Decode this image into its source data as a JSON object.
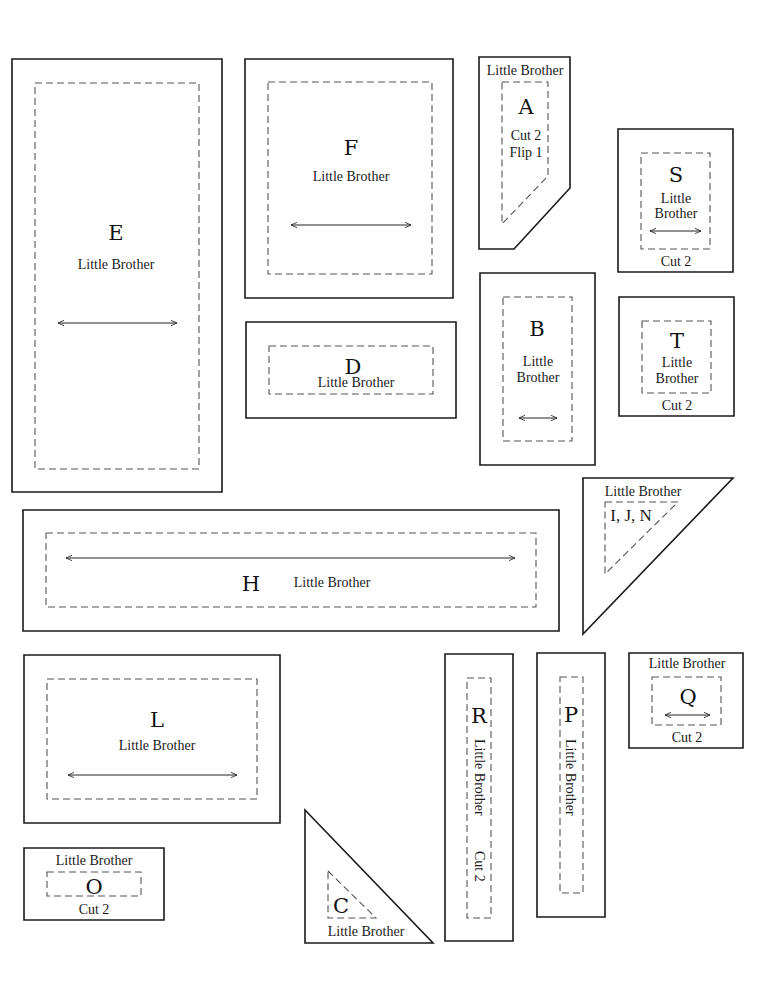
{
  "sheet": {
    "width": 782,
    "height": 986,
    "colors": {
      "background": "#ffffff",
      "cut_line": "#1a1a1a",
      "seam_line": "#555555",
      "text": "#1a1a1a"
    }
  },
  "pieces": [
    {
      "id": "E",
      "outline": [
        [
          12,
          59
        ],
        [
          222,
          59
        ],
        [
          222,
          492
        ],
        [
          12,
          492
        ]
      ],
      "seam": [
        [
          35,
          83
        ],
        [
          199,
          83
        ],
        [
          199,
          469
        ],
        [
          35,
          469
        ]
      ],
      "texts": [
        {
          "text": "E",
          "x": 116,
          "y": 240,
          "kind": "letter"
        },
        {
          "text": "Little Brother",
          "x": 116,
          "y": 269,
          "kind": "label"
        }
      ],
      "grainline": [
        58,
        323,
        177,
        323
      ]
    },
    {
      "id": "F",
      "outline": [
        [
          245,
          59
        ],
        [
          453,
          59
        ],
        [
          453,
          298
        ],
        [
          245,
          298
        ]
      ],
      "seam": [
        [
          268,
          82
        ],
        [
          432,
          82
        ],
        [
          432,
          274
        ],
        [
          268,
          274
        ]
      ],
      "texts": [
        {
          "text": "F",
          "x": 351,
          "y": 155,
          "kind": "letter"
        },
        {
          "text": "Little Brother",
          "x": 351,
          "y": 181,
          "kind": "label"
        }
      ],
      "grainline": [
        291,
        225,
        411,
        225
      ]
    },
    {
      "id": "A",
      "outline": [
        [
          479,
          57
        ],
        [
          570,
          57
        ],
        [
          570,
          188
        ],
        [
          514,
          249
        ],
        [
          479,
          249
        ]
      ],
      "seam": [
        [
          502,
          82
        ],
        [
          548,
          82
        ],
        [
          548,
          176
        ],
        [
          502,
          224
        ]
      ],
      "seam_open": false,
      "texts": [
        {
          "text": "Little Brother",
          "x": 525,
          "y": 75,
          "kind": "label"
        },
        {
          "text": "A",
          "x": 526,
          "y": 114,
          "kind": "letter"
        },
        {
          "text": "Cut 2",
          "x": 526,
          "y": 140,
          "kind": "label"
        },
        {
          "text": "Flip 1",
          "x": 526,
          "y": 157,
          "kind": "label"
        }
      ]
    },
    {
      "id": "S",
      "outline": [
        [
          618,
          129
        ],
        [
          733,
          129
        ],
        [
          733,
          272
        ],
        [
          618,
          272
        ]
      ],
      "seam": [
        [
          641,
          153
        ],
        [
          710,
          153
        ],
        [
          710,
          249
        ],
        [
          641,
          249
        ]
      ],
      "texts": [
        {
          "text": "S",
          "x": 676,
          "y": 182,
          "kind": "letter"
        },
        {
          "text": "Little",
          "x": 676,
          "y": 203,
          "kind": "label"
        },
        {
          "text": "Brother",
          "x": 676,
          "y": 218,
          "kind": "label"
        }
      ],
      "grainline": [
        650,
        231,
        701,
        231
      ],
      "caption": {
        "text": "Cut 2",
        "x": 676,
        "y": 266
      }
    },
    {
      "id": "D",
      "outline": [
        [
          246,
          322
        ],
        [
          456,
          322
        ],
        [
          456,
          418
        ],
        [
          246,
          418
        ]
      ],
      "seam": [
        [
          269,
          346
        ],
        [
          433,
          346
        ],
        [
          433,
          394
        ],
        [
          269,
          394
        ]
      ],
      "texts": [
        {
          "text": "D",
          "x": 353,
          "y": 374,
          "kind": "letter"
        },
        {
          "text": "Little Brother",
          "x": 356,
          "y": 387,
          "kind": "label"
        }
      ]
    },
    {
      "id": "B",
      "outline": [
        [
          480,
          273
        ],
        [
          595,
          273
        ],
        [
          595,
          465
        ],
        [
          480,
          465
        ]
      ],
      "seam": [
        [
          503,
          297
        ],
        [
          572,
          297
        ],
        [
          572,
          441
        ],
        [
          503,
          441
        ]
      ],
      "texts": [
        {
          "text": "B",
          "x": 537,
          "y": 336,
          "kind": "letter"
        },
        {
          "text": "Little",
          "x": 538,
          "y": 366,
          "kind": "label"
        },
        {
          "text": "Brother",
          "x": 538,
          "y": 382,
          "kind": "label"
        }
      ],
      "grainline": [
        519,
        418,
        557,
        418
      ]
    },
    {
      "id": "T",
      "outline": [
        [
          619,
          297
        ],
        [
          734,
          297
        ],
        [
          734,
          416
        ],
        [
          619,
          416
        ]
      ],
      "seam": [
        [
          642,
          321
        ],
        [
          711,
          321
        ],
        [
          711,
          393
        ],
        [
          642,
          393
        ]
      ],
      "texts": [
        {
          "text": "T",
          "x": 677,
          "y": 348,
          "kind": "letter"
        },
        {
          "text": "Little",
          "x": 677,
          "y": 367,
          "kind": "label"
        },
        {
          "text": "Brother",
          "x": 677,
          "y": 383,
          "kind": "label"
        }
      ],
      "caption": {
        "text": "Cut 2",
        "x": 677,
        "y": 410
      }
    },
    {
      "id": "H",
      "outline": [
        [
          23,
          510
        ],
        [
          559,
          510
        ],
        [
          559,
          631
        ],
        [
          23,
          631
        ]
      ],
      "seam": [
        [
          46,
          533
        ],
        [
          536,
          533
        ],
        [
          536,
          607
        ],
        [
          46,
          607
        ]
      ],
      "texts": [
        {
          "text": "H",
          "x": 251,
          "y": 591,
          "kind": "letter"
        },
        {
          "text": "Little Brother",
          "x": 332,
          "y": 587,
          "kind": "label"
        }
      ],
      "grainline": [
        66,
        558,
        515,
        558
      ]
    },
    {
      "id": "IJN",
      "outline": [
        [
          583,
          478
        ],
        [
          733,
          478
        ],
        [
          583,
          634
        ]
      ],
      "seam": [
        [
          605,
          502
        ],
        [
          678,
          502
        ],
        [
          605,
          574
        ]
      ],
      "texts": [
        {
          "text": "Little Brother",
          "x": 643,
          "y": 496,
          "kind": "label"
        },
        {
          "text": "I, J, N",
          "x": 631,
          "y": 521,
          "kind": "label-large"
        }
      ]
    },
    {
      "id": "L",
      "outline": [
        [
          24,
          655
        ],
        [
          280,
          655
        ],
        [
          280,
          823
        ],
        [
          24,
          823
        ]
      ],
      "seam": [
        [
          47,
          679
        ],
        [
          257,
          679
        ],
        [
          257,
          799
        ],
        [
          47,
          799
        ]
      ],
      "texts": [
        {
          "text": "L",
          "x": 157,
          "y": 727,
          "kind": "letter"
        },
        {
          "text": "Little Brother",
          "x": 157,
          "y": 750,
          "kind": "label"
        }
      ],
      "grainline": [
        68,
        775,
        237,
        775
      ]
    },
    {
      "id": "R",
      "outline": [
        [
          445,
          654
        ],
        [
          513,
          654
        ],
        [
          513,
          941
        ],
        [
          445,
          941
        ]
      ],
      "seam": [
        [
          467,
          678
        ],
        [
          491,
          678
        ],
        [
          491,
          918
        ],
        [
          467,
          918
        ]
      ],
      "texts": [
        {
          "text": "R",
          "x": 479,
          "y": 723,
          "kind": "letter"
        }
      ],
      "vertical_texts": [
        {
          "text": "Little Brother",
          "x": 478,
          "y": 739
        },
        {
          "text": "Cut 2",
          "x": 478,
          "y": 851
        }
      ]
    },
    {
      "id": "P",
      "outline": [
        [
          537,
          653
        ],
        [
          605,
          653
        ],
        [
          605,
          917
        ],
        [
          537,
          917
        ]
      ],
      "seam": [
        [
          560,
          677
        ],
        [
          583,
          677
        ],
        [
          583,
          893
        ],
        [
          560,
          893
        ]
      ],
      "texts": [
        {
          "text": "P",
          "x": 571,
          "y": 722,
          "kind": "letter"
        }
      ],
      "vertical_texts": [
        {
          "text": "Little Brother",
          "x": 569,
          "y": 739
        }
      ]
    },
    {
      "id": "Q",
      "outline": [
        [
          629,
          653
        ],
        [
          743,
          653
        ],
        [
          743,
          748
        ],
        [
          629,
          748
        ]
      ],
      "seam": [
        [
          652,
          677
        ],
        [
          721,
          677
        ],
        [
          721,
          725
        ],
        [
          652,
          725
        ]
      ],
      "texts": [
        {
          "text": "Little Brother",
          "x": 687,
          "y": 668,
          "kind": "label"
        },
        {
          "text": "Q",
          "x": 688,
          "y": 704,
          "kind": "letter"
        }
      ],
      "grainline": [
        665,
        715,
        710,
        715
      ],
      "caption": {
        "text": "Cut 2",
        "x": 687,
        "y": 742
      }
    },
    {
      "id": "O",
      "outline": [
        [
          24,
          848
        ],
        [
          164,
          848
        ],
        [
          164,
          920
        ],
        [
          24,
          920
        ]
      ],
      "seam": [
        [
          47,
          872
        ],
        [
          141,
          872
        ],
        [
          141,
          896
        ],
        [
          47,
          896
        ]
      ],
      "texts": [
        {
          "text": "Little Brother",
          "x": 94,
          "y": 865,
          "kind": "label"
        },
        {
          "text": "O",
          "x": 94,
          "y": 894,
          "kind": "letter"
        }
      ],
      "caption": {
        "text": "Cut 2",
        "x": 94,
        "y": 914
      }
    },
    {
      "id": "C",
      "outline": [
        [
          305,
          810
        ],
        [
          433,
          943
        ],
        [
          305,
          943
        ]
      ],
      "seam": [
        [
          328,
          871
        ],
        [
          376,
          918
        ],
        [
          328,
          918
        ]
      ],
      "texts": [
        {
          "text": "C",
          "x": 341,
          "y": 913,
          "kind": "letter"
        },
        {
          "text": "Little Brother",
          "x": 366,
          "y": 936,
          "kind": "label"
        }
      ]
    }
  ]
}
